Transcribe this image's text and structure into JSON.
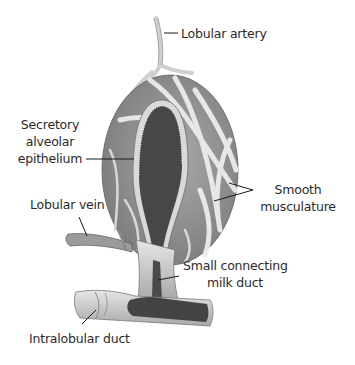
{
  "figure": {
    "labels": {
      "lobular_artery": "Lobular artery",
      "secretory_epithelium": [
        "Secretory",
        "alveolar",
        "epithelium"
      ],
      "smooth_musculature": [
        "Smooth",
        "musculature"
      ],
      "lobular_vein": "Lobular vein",
      "connecting_duct": [
        "Small connecting",
        "milk duct"
      ],
      "intralobular_duct": "Intralobular duct"
    },
    "colors": {
      "background": "#ffffff",
      "text": "#2a2a2a",
      "alveolus_outer": "#9a9a9a",
      "muscle_bands": "#e8e8e8",
      "lumen": "#4a4a4a",
      "duct_wall": "#bdbdbd",
      "leader": "#1a1a1a"
    }
  }
}
